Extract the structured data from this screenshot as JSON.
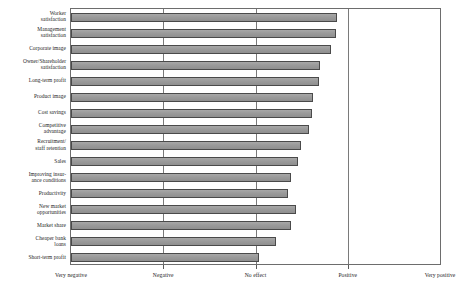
{
  "chart_data": {
    "type": "bar",
    "orientation": "horizontal",
    "title": "",
    "subtitle": "",
    "xlabel": "",
    "ylabel": "",
    "grid": true,
    "legend": false,
    "legend_position": "none",
    "bar_color": "#9c9c9c",
    "bar_edge_color": "#4a4a4a",
    "axis_color": "#6d6d6d",
    "background_color": "#ffffff",
    "xlim": [
      0,
      4
    ],
    "xticks": [
      0,
      1,
      2,
      3,
      4
    ],
    "xticklabels": [
      "Very negative",
      "Negative",
      "No effect",
      "Positive",
      "Very positive"
    ],
    "categories": [
      "Worker\nsatisfaction",
      "Management\nsatisfaction",
      "Corporate image",
      "Owner/Shareholder\nsatisfaction",
      "Long-term profit",
      "Product image",
      "Cost savings",
      "Competitive\nadvantage",
      "Recruitment/\nstaff retention",
      "Sales",
      "Improving insur-\nance conditions",
      "Productivity",
      "New market\nopportunities",
      "Market share",
      "Cheaper bank\nloans",
      "Short-term profit"
    ],
    "values": [
      2.88,
      2.87,
      2.82,
      2.7,
      2.69,
      2.62,
      2.61,
      2.58,
      2.49,
      2.46,
      2.39,
      2.35,
      2.44,
      2.38,
      2.22,
      2.04
    ],
    "value_units": "scale position (0 = Very negative, 4 = Very positive)"
  }
}
